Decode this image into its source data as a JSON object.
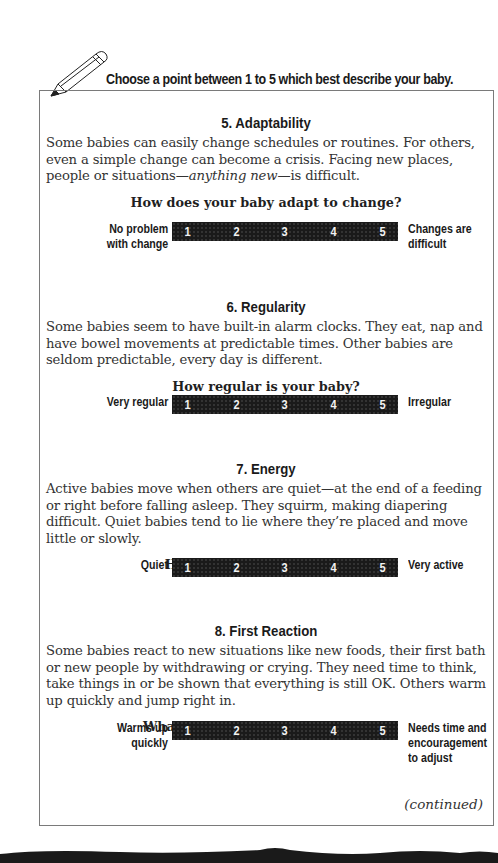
{
  "instruction": "Choose a point between 1 to 5 which best describe your baby.",
  "scale_points": [
    "1",
    "2",
    "3",
    "4",
    "5"
  ],
  "sections": [
    {
      "title": "5.  Adaptability",
      "body_html_parts": {
        "pre": "Some babies can easily change schedules or routines. For others, even a simple change can become a crisis. Facing new places, people or situations—",
        "em": "anything new",
        "post": "—is difficult."
      },
      "question": "How does your baby adapt to change?",
      "left_label": "No problem\nwith change",
      "right_label": "Changes are\ndifficult"
    },
    {
      "title": "6.  Regularity",
      "body": "Some babies seem to have built-in alarm clocks. They eat, nap and have bowel movements at predictable times. Other babies are seldom predictable, every day is different.",
      "question": "How regular is your baby?",
      "left_label": "Very regular",
      "right_label": "Irregular"
    },
    {
      "title": "7.  Energy",
      "body": "Active babies move when others are quiet—at the end of a feeding or right before falling asleep. They squirm, making diapering difficult. Quiet babies tend to lie where they’re placed and move little or slowly.",
      "question": "How energetic is your baby?",
      "left_label": "Quiet",
      "right_label": "Very active"
    },
    {
      "title": "8.  First Reaction",
      "body": "Some babies react to new situations like new foods, their first bath or new people by withdrawing or crying. They need time to think, take things in or be shown that everything is still OK. Others warm up quickly and jump right in.",
      "question": "What is your baby’s first reaction?",
      "left_label": "Warms up\nquickly",
      "right_label": "Needs time and\nencouragement\nto adjust"
    }
  ],
  "footer": {
    "continued": "(continued)"
  }
}
